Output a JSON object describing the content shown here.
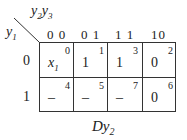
{
  "kmap": {
    "col_var": "y2y3",
    "row_var": "y1",
    "col_headers": [
      "0 0",
      "0 1",
      "1 1",
      "10"
    ],
    "row_headers": [
      "0",
      "1"
    ],
    "cells": [
      [
        {
          "value": "x1",
          "index": "0"
        },
        {
          "value": "1",
          "index": "1"
        },
        {
          "value": "1",
          "index": "3"
        },
        {
          "value": "0",
          "index": "2"
        }
      ],
      [
        {
          "value": "–",
          "index": "4"
        },
        {
          "value": "–",
          "index": "5"
        },
        {
          "value": "–",
          "index": "7"
        },
        {
          "value": "0",
          "index": "6"
        }
      ]
    ],
    "caption": "Dy2"
  }
}
